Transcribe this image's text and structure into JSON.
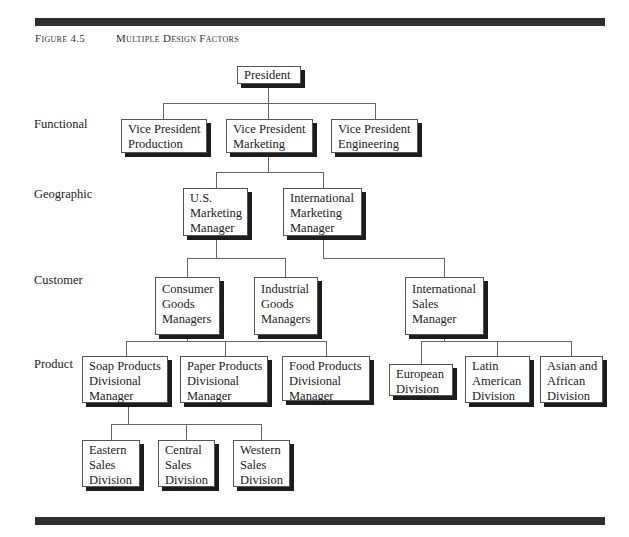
{
  "figure": {
    "number": "Figure 4.5",
    "title": "Multiple Design Factors"
  },
  "levels": {
    "functional": "Functional",
    "geographic": "Geographic",
    "customer": "Customer",
    "product": "Product"
  },
  "nodes": {
    "president": [
      "President"
    ],
    "vp_production": [
      "Vice President",
      "Production"
    ],
    "vp_marketing": [
      "Vice President",
      "Marketing"
    ],
    "vp_engineering": [
      "Vice President",
      "Engineering"
    ],
    "us_marketing": [
      "U.S.",
      "Marketing",
      "Manager"
    ],
    "intl_marketing": [
      "International",
      "Marketing",
      "Manager"
    ],
    "consumer_goods": [
      "Consumer",
      "Goods",
      "Managers"
    ],
    "industrial_goods": [
      "Industrial",
      "Goods",
      "Managers"
    ],
    "intl_sales": [
      "International",
      "Sales",
      "Manager"
    ],
    "soap": [
      "Soap Products",
      "Divisional",
      "Manager"
    ],
    "paper": [
      "Paper Products",
      "Divisional",
      "Manager"
    ],
    "food": [
      "Food Products",
      "Divisional",
      "Manager"
    ],
    "european": [
      "European",
      "Division"
    ],
    "latin_american": [
      "Latin",
      "American",
      "Division"
    ],
    "asian_african": [
      "Asian and",
      "African",
      "Division"
    ],
    "eastern": [
      "Eastern",
      "Sales",
      "Division"
    ],
    "central": [
      "Central",
      "Sales",
      "Division"
    ],
    "western": [
      "Western",
      "Sales",
      "Division"
    ]
  }
}
